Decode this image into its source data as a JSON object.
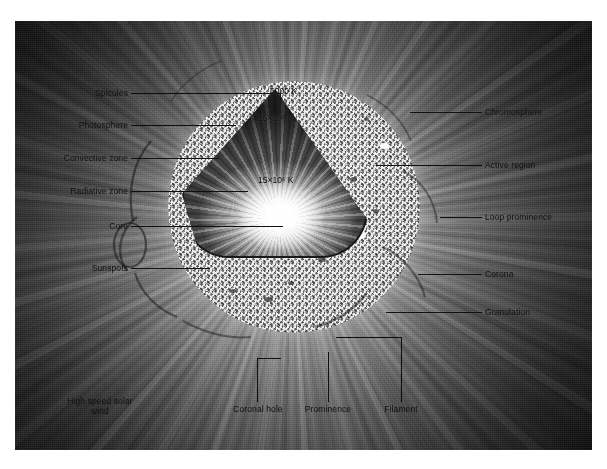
{
  "figure": {
    "accent_color": "#101010",
    "plate_background": "#4c4c4c",
    "photosphere_color": "#cfcfcf"
  },
  "temperatures": [
    {
      "id": "surface",
      "value": "6000",
      "exponent": "",
      "unit": "K",
      "text": "6000 K"
    },
    {
      "id": "chromosphere",
      "value": "15×10",
      "exponent": "5",
      "unit": "K",
      "text": "15×10⁵ K"
    },
    {
      "id": "core",
      "value": "15×10",
      "exponent": "6",
      "unit": "K",
      "text": "15×10⁶ K"
    }
  ],
  "labels_left": [
    {
      "id": "spicules",
      "text": "Spicules"
    },
    {
      "id": "photosphere",
      "text": "Photosphere"
    },
    {
      "id": "convective-zone",
      "text": "Convective zone"
    },
    {
      "id": "radiative-zone",
      "text": "Radiative zone"
    },
    {
      "id": "core",
      "text": "Core"
    },
    {
      "id": "sunspots",
      "text": "Sunspots"
    }
  ],
  "labels_right": [
    {
      "id": "chromosphere",
      "text": "Chromosphere"
    },
    {
      "id": "active-region",
      "text": "Active region"
    },
    {
      "id": "loop-prominence",
      "text": "Loop prominence"
    },
    {
      "id": "corona",
      "text": "Corona"
    },
    {
      "id": "granulation",
      "text": "Granulation"
    }
  ],
  "labels_bottom": [
    {
      "id": "coronal-hole",
      "text": "Coronal hole"
    },
    {
      "id": "prominence",
      "text": "Prominence"
    },
    {
      "id": "filament",
      "text": "Filament"
    }
  ],
  "labels_free": [
    {
      "id": "high-speed-solar-wind",
      "line1": "High speed solar",
      "line2": "wind"
    }
  ]
}
